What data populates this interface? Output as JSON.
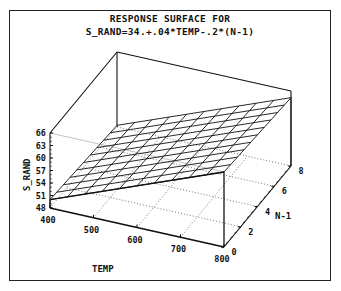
{
  "chart_data": {
    "type": "surface3d",
    "title": "RESPONSE SURFACE FOR",
    "subtitle": "S_RAND=34.+.04*TEMP-.2*(N-1)",
    "equation": {
      "intercept": 34,
      "coef_x": 0.04,
      "coef_y": -0.2
    },
    "x": {
      "label": "TEMP",
      "range": [
        400,
        800
      ],
      "ticks": [
        400,
        500,
        600,
        700,
        800
      ],
      "tick_labels": [
        "400",
        "500",
        "600",
        "700",
        "800"
      ]
    },
    "y": {
      "label": "N-1",
      "range": [
        0,
        8
      ],
      "ticks": [
        0,
        2,
        4,
        6,
        8
      ],
      "tick_labels": [
        "0",
        "2",
        "4",
        "6",
        "8"
      ]
    },
    "z": {
      "label": "S_RAND",
      "range": [
        48,
        66
      ],
      "ticks": [
        48,
        51,
        54,
        57,
        60,
        63,
        66
      ],
      "tick_labels": [
        "48",
        "51",
        "54",
        "57",
        "60",
        "63",
        "66"
      ]
    },
    "grid": {
      "x_steps": 10,
      "y_steps": 10
    },
    "surface_corners": [
      {
        "TEMP": 400,
        "N-1": 0,
        "S_RAND": 50.0
      },
      {
        "TEMP": 800,
        "N-1": 0,
        "S_RAND": 66.0
      },
      {
        "TEMP": 800,
        "N-1": 8,
        "S_RAND": 64.4
      },
      {
        "TEMP": 400,
        "N-1": 8,
        "S_RAND": 48.4
      }
    ],
    "floor_grid": "dotted",
    "legend": "none"
  }
}
